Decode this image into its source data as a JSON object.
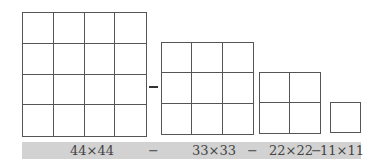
{
  "diagram": {
    "squares": [
      {
        "name": "grid-4x4",
        "cells": 4,
        "left": 22,
        "top": 12,
        "size": 125
      },
      {
        "name": "grid-3x3",
        "cells": 3,
        "left": 161,
        "top": 42,
        "size": 93
      },
      {
        "name": "grid-2x2",
        "cells": 2,
        "left": 259,
        "top": 72,
        "size": 62
      },
      {
        "name": "grid-1x1",
        "cells": 1,
        "left": 330,
        "top": 102,
        "size": 31
      }
    ],
    "operator_between_grids": "−"
  },
  "formula": {
    "term1": "44×44",
    "op1": "−",
    "term2": "33×33",
    "op2": "−",
    "term3": "22×22",
    "op3": "−",
    "term4": "11×11",
    "bar_color": "#d2d2d2"
  }
}
